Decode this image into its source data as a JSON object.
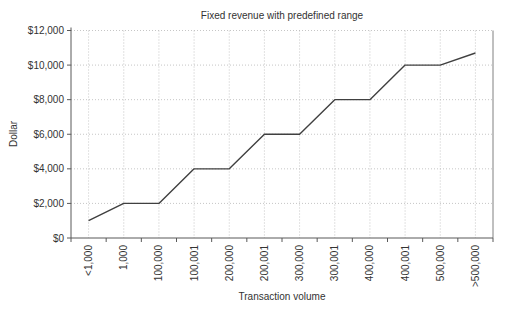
{
  "chart_data": {
    "type": "line",
    "title": "Fixed revenue with predefined range",
    "xlabel": "Transaction volume",
    "ylabel": "Dollar",
    "categories": [
      "<1,000",
      "1,000",
      "100,000",
      "100,001",
      "200,000",
      "200,001",
      "300,000",
      "300,001",
      "400,000",
      "400,001",
      "500,000",
      ">500,000"
    ],
    "values": [
      1000,
      2000,
      2000,
      4000,
      4000,
      6000,
      6000,
      8000,
      8000,
      10000,
      10000,
      10700
    ],
    "ylim": [
      0,
      12000
    ],
    "ytick_step": 2000,
    "ytick_labels": [
      "$0",
      "$2,000",
      "$4,000",
      "$6,000",
      "$8,000",
      "$10,000",
      "$12,000"
    ],
    "xtick_labels_rotation": "vertical",
    "grid": "dotted horizontal and vertical",
    "legend": "none",
    "colors": {
      "line": "#404040",
      "grid": "#b8b8b8",
      "axis": "#595959",
      "plot_border": "#808080",
      "text": "#333333",
      "background": "#ffffff"
    }
  }
}
